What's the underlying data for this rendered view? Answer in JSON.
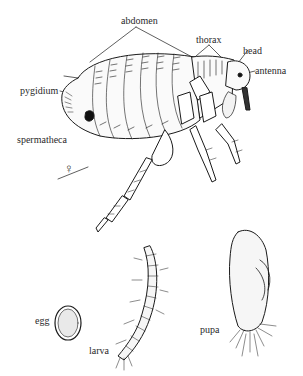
{
  "diagram": {
    "adult": {
      "labels": {
        "abdomen": "abdomen",
        "thorax": "thorax",
        "head": "head",
        "antenna": "antenna",
        "pygidium": "pygidium",
        "spermatheca": "spermatheca"
      },
      "sex_symbol": "♀"
    },
    "stages": {
      "egg": "egg",
      "larva": "larva",
      "pupa": "pupa"
    },
    "colors": {
      "line": "#1a1a1a",
      "text": "#2a2a2a",
      "background": "#ffffff"
    }
  }
}
